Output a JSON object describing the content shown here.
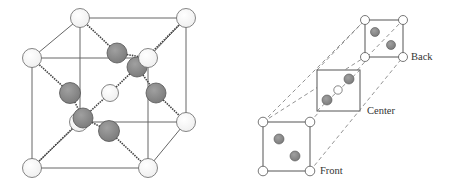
{
  "figure": {
    "left_panel": {
      "description": "Cubic unit cell with white corner atoms, white central atom, and shaded atoms on body diagonal and face positions",
      "colors": {
        "white_atom": "#ffffff",
        "shaded_atom": "#8a8a8a",
        "edge": "#555555",
        "bond": "#444444"
      }
    },
    "right_panel": {
      "labels": {
        "back": "Back",
        "center": "Center",
        "front": "Front"
      },
      "colors": {
        "white_atom": "#ffffff",
        "shaded_atom": "#8a8a8a",
        "edge": "#555555",
        "dashed": "#666666"
      }
    }
  }
}
